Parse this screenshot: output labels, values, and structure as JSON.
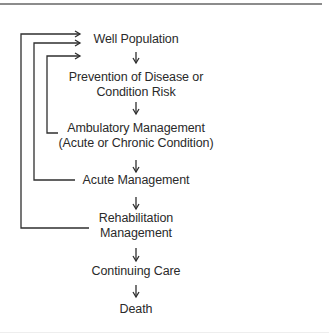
{
  "diagram": {
    "type": "flowchart",
    "orientation": "vertical",
    "nodes": [
      {
        "id": "well",
        "lines": [
          "Well Population"
        ]
      },
      {
        "id": "prevention",
        "lines": [
          "Prevention of Disease or",
          "Condition Risk"
        ]
      },
      {
        "id": "ambulatory",
        "lines": [
          "Ambulatory Management",
          "(Acute or Chronic Condition)"
        ]
      },
      {
        "id": "acute",
        "lines": [
          "Acute Management"
        ]
      },
      {
        "id": "rehab",
        "lines": [
          "Rehabilitation",
          "Management"
        ]
      },
      {
        "id": "continuing",
        "lines": [
          "Continuing Care"
        ]
      },
      {
        "id": "death",
        "lines": [
          "Death"
        ]
      }
    ],
    "edges": [
      {
        "from": "well",
        "to": "prevention"
      },
      {
        "from": "prevention",
        "to": "ambulatory"
      },
      {
        "from": "ambulatory",
        "to": "acute"
      },
      {
        "from": "acute",
        "to": "rehab"
      },
      {
        "from": "rehab",
        "to": "continuing"
      },
      {
        "from": "continuing",
        "to": "death"
      },
      {
        "from": "ambulatory",
        "to": "well",
        "kind": "feedback"
      },
      {
        "from": "acute",
        "to": "well",
        "kind": "feedback"
      },
      {
        "from": "rehab",
        "to": "well",
        "kind": "feedback"
      }
    ],
    "colors": {
      "line": "#2f2f2f",
      "text": "#2a2a2a",
      "rule": "#8c8c8c"
    }
  }
}
